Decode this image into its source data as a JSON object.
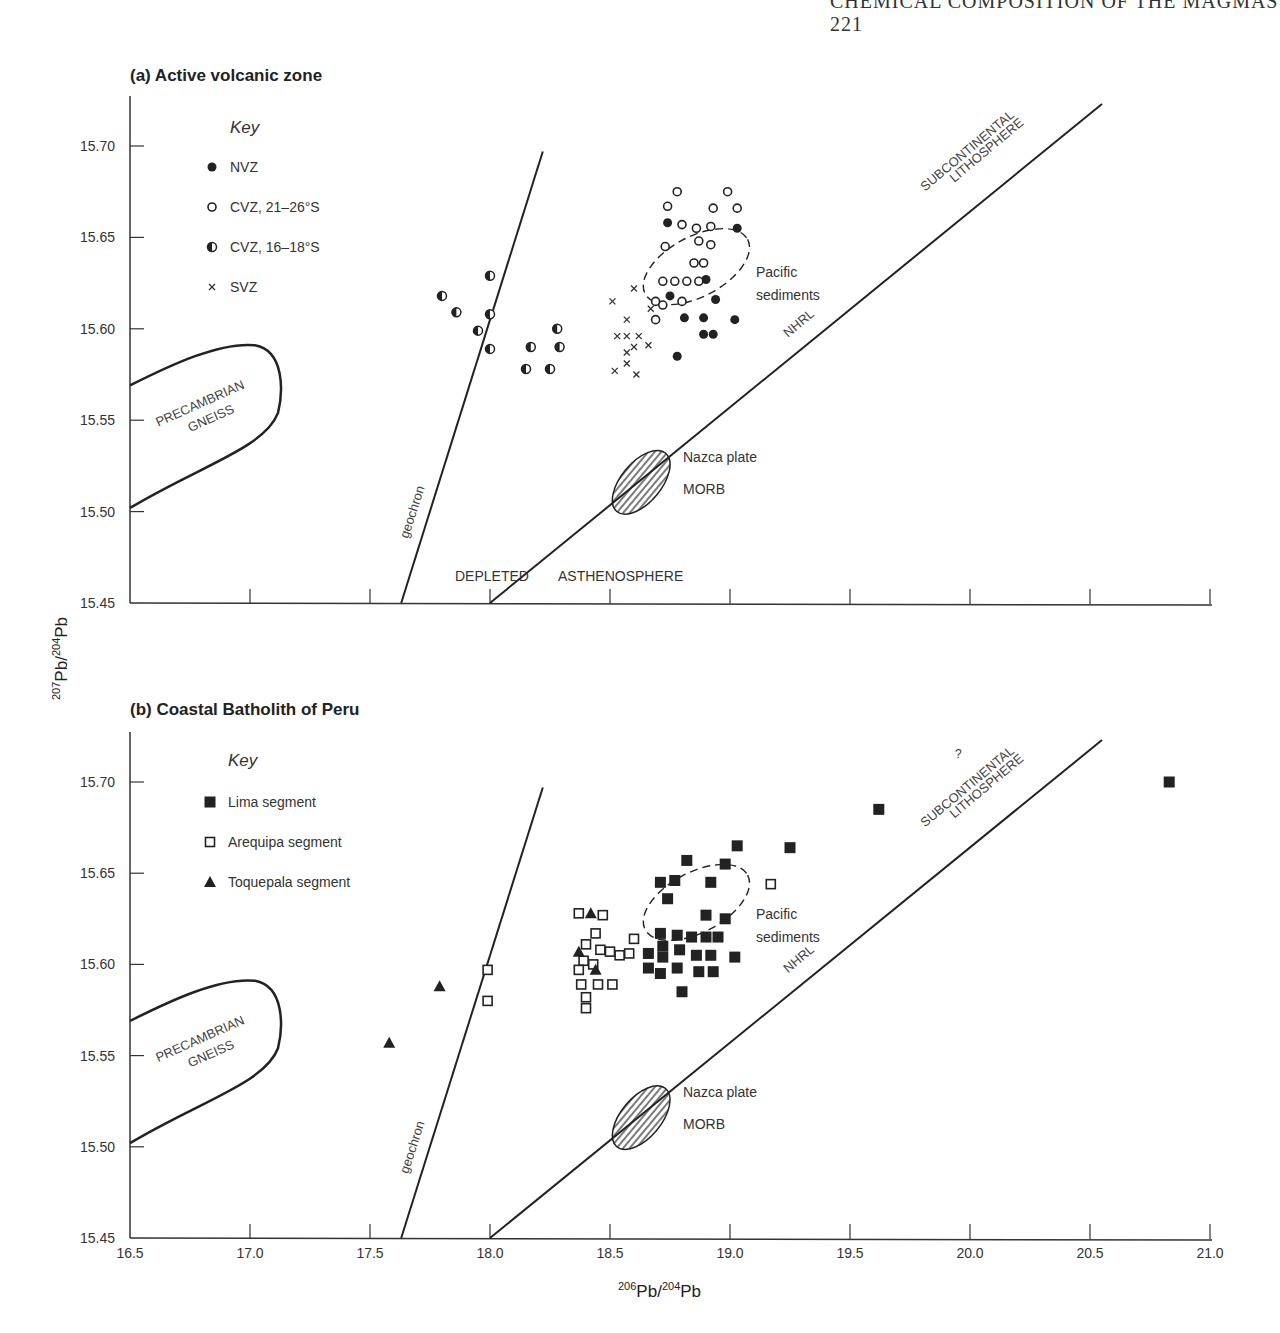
{
  "running_head": "CHEMICAL COMPOSITION OF THE MAGMAS   221",
  "y_axis_label": {
    "sup1": "207",
    "base1": "Pb/",
    "sup2": "204",
    "base2": "Pb"
  },
  "x_axis_label": {
    "sup1": "206",
    "base1": "Pb/",
    "sup2": "204",
    "base2": "Pb"
  },
  "panels": [
    {
      "title": "(a) Active volcanic zone",
      "key_title": "Key",
      "legend": [
        "NVZ",
        "CVZ, 21–26°S",
        "CVZ, 16–18°S",
        "SVZ"
      ],
      "labels": {
        "gneiss1": "PRECAMBRIAN",
        "gneiss2": "GNEISS",
        "geochron": "geochron",
        "depleted": "DEPLETED",
        "asthenosphere": "ASTHENOSPHERE",
        "nazca1": "Nazca plate",
        "nazca2": "MORB",
        "pacific1": "Pacific",
        "pacific2": "sediments",
        "nhrl": "NHRL",
        "subcont1": "SUBCONTINENTAL",
        "subcont2": "LITHOSPHERE"
      },
      "y_ticks": [
        "15.70",
        "15.65",
        "15.60",
        "15.55",
        "15.50",
        "15.45"
      ]
    },
    {
      "title": "(b) Coastal Batholith of Peru",
      "key_title": "Key",
      "legend": [
        "Lima segment",
        "Arequipa segment",
        "Toquepala segment"
      ],
      "labels": {
        "gneiss1": "PRECAMBRIAN",
        "gneiss2": "GNEISS",
        "geochron": "geochron",
        "nazca1": "Nazca plate",
        "nazca2": "MORB",
        "pacific1": "Pacific",
        "pacific2": "sediments",
        "nhrl": "NHRL",
        "question": "?",
        "subcont1": "SUBCONTINENTAL",
        "subcont2": "LITHOSPHERE"
      },
      "y_ticks": [
        "15.70",
        "15.65",
        "15.60",
        "15.55",
        "15.50",
        "15.45"
      ],
      "x_ticks": [
        "16.5",
        "17.0",
        "17.5",
        "18.0",
        "18.5",
        "19.0",
        "19.5",
        "20.0",
        "20.5",
        "21.0"
      ]
    }
  ],
  "chart_data": [
    {
      "type": "scatter",
      "title": "(a) Active volcanic zone",
      "xlabel": "206Pb/204Pb",
      "ylabel": "207Pb/204Pb",
      "xlim": [
        16.5,
        21.0
      ],
      "ylim": [
        15.45,
        15.72
      ],
      "grid": false,
      "legend_position": "upper-left",
      "series": [
        {
          "name": "NVZ",
          "marker": "filled-circle",
          "points": [
            [
              18.74,
              15.658
            ],
            [
              19.03,
              15.655
            ],
            [
              18.9,
              15.627
            ],
            [
              18.75,
              15.618
            ],
            [
              18.94,
              15.616
            ],
            [
              18.81,
              15.606
            ],
            [
              18.89,
              15.606
            ],
            [
              19.02,
              15.605
            ],
            [
              18.89,
              15.597
            ],
            [
              18.93,
              15.597
            ],
            [
              18.78,
              15.585
            ]
          ]
        },
        {
          "name": "CVZ, 21–26°S",
          "marker": "open-circle",
          "points": [
            [
              18.78,
              15.675
            ],
            [
              18.99,
              15.675
            ],
            [
              18.74,
              15.667
            ],
            [
              18.93,
              15.666
            ],
            [
              19.03,
              15.666
            ],
            [
              18.8,
              15.657
            ],
            [
              18.86,
              15.655
            ],
            [
              18.92,
              15.656
            ],
            [
              18.73,
              15.645
            ],
            [
              18.87,
              15.648
            ],
            [
              18.92,
              15.646
            ],
            [
              18.85,
              15.636
            ],
            [
              18.89,
              15.636
            ],
            [
              18.72,
              15.626
            ],
            [
              18.77,
              15.626
            ],
            [
              18.82,
              15.626
            ],
            [
              18.87,
              15.626
            ],
            [
              18.69,
              15.615
            ],
            [
              18.72,
              15.613
            ],
            [
              18.8,
              15.615
            ],
            [
              18.69,
              15.605
            ]
          ]
        },
        {
          "name": "CVZ, 16–18°S",
          "marker": "half-filled-circle",
          "points": [
            [
              18.0,
              15.629
            ],
            [
              17.8,
              15.618
            ],
            [
              17.86,
              15.609
            ],
            [
              18.0,
              15.608
            ],
            [
              17.95,
              15.599
            ],
            [
              18.28,
              15.6
            ],
            [
              18.0,
              15.589
            ],
            [
              18.17,
              15.59
            ],
            [
              18.29,
              15.59
            ],
            [
              18.15,
              15.578
            ],
            [
              18.25,
              15.578
            ]
          ]
        },
        {
          "name": "SVZ",
          "marker": "x",
          "points": [
            [
              18.51,
              15.615
            ],
            [
              18.6,
              15.622
            ],
            [
              18.57,
              15.605
            ],
            [
              18.53,
              15.596
            ],
            [
              18.57,
              15.596
            ],
            [
              18.62,
              15.596
            ],
            [
              18.57,
              15.587
            ],
            [
              18.6,
              15.59
            ],
            [
              18.66,
              15.591
            ],
            [
              18.52,
              15.577
            ],
            [
              18.57,
              15.581
            ],
            [
              18.61,
              15.575
            ],
            [
              18.67,
              15.611
            ]
          ]
        }
      ],
      "reference_lines": [
        {
          "name": "geochron",
          "from": [
            17.63,
            15.45
          ],
          "to": [
            18.22,
            15.697
          ]
        },
        {
          "name": "NHRL",
          "from": [
            18.0,
            15.45
          ],
          "to": [
            20.55,
            15.723
          ]
        }
      ],
      "fields": [
        {
          "name": "Precambrian gneiss",
          "type": "outline"
        },
        {
          "name": "Nazca plate MORB",
          "type": "hatched-ellipse",
          "center": [
            18.63,
            15.516
          ]
        },
        {
          "name": "Pacific sediments",
          "type": "dashed-ellipse",
          "center": [
            18.86,
            15.634
          ]
        }
      ]
    },
    {
      "type": "scatter",
      "title": "(b) Coastal Batholith of Peru",
      "xlabel": "206Pb/204Pb",
      "ylabel": "207Pb/204Pb",
      "xlim": [
        16.5,
        21.0
      ],
      "ylim": [
        15.45,
        15.72
      ],
      "x_ticks": [
        16.5,
        17.0,
        17.5,
        18.0,
        18.5,
        19.0,
        19.5,
        20.0,
        20.5,
        21.0
      ],
      "y_ticks": [
        15.45,
        15.5,
        15.55,
        15.6,
        15.65,
        15.7
      ],
      "grid": false,
      "legend_position": "upper-left",
      "series": [
        {
          "name": "Lima segment",
          "marker": "filled-square",
          "points": [
            [
              20.83,
              15.7
            ],
            [
              19.62,
              15.685
            ],
            [
              19.03,
              15.665
            ],
            [
              19.25,
              15.664
            ],
            [
              18.82,
              15.657
            ],
            [
              18.98,
              15.655
            ],
            [
              18.71,
              15.645
            ],
            [
              18.77,
              15.646
            ],
            [
              18.92,
              15.645
            ],
            [
              18.74,
              15.636
            ],
            [
              18.9,
              15.627
            ],
            [
              18.98,
              15.625
            ],
            [
              18.71,
              15.617
            ],
            [
              18.78,
              15.616
            ],
            [
              18.84,
              15.615
            ],
            [
              18.9,
              15.615
            ],
            [
              18.95,
              15.615
            ],
            [
              18.72,
              15.61
            ],
            [
              18.79,
              15.608
            ],
            [
              18.66,
              15.606
            ],
            [
              18.72,
              15.604
            ],
            [
              18.86,
              15.605
            ],
            [
              18.92,
              15.605
            ],
            [
              19.02,
              15.604
            ],
            [
              18.66,
              15.598
            ],
            [
              18.71,
              15.595
            ],
            [
              18.78,
              15.598
            ],
            [
              18.87,
              15.596
            ],
            [
              18.93,
              15.596
            ],
            [
              18.8,
              15.585
            ]
          ]
        },
        {
          "name": "Arequipa segment",
          "marker": "open-square",
          "points": [
            [
              19.17,
              15.644
            ],
            [
              18.37,
              15.628
            ],
            [
              18.47,
              15.627
            ],
            [
              18.44,
              15.617
            ],
            [
              18.6,
              15.614
            ],
            [
              18.4,
              15.611
            ],
            [
              18.46,
              15.608
            ],
            [
              18.5,
              15.607
            ],
            [
              18.54,
              15.605
            ],
            [
              18.58,
              15.606
            ],
            [
              18.39,
              15.602
            ],
            [
              18.37,
              15.597
            ],
            [
              18.43,
              15.6
            ],
            [
              18.38,
              15.589
            ],
            [
              18.45,
              15.589
            ],
            [
              18.51,
              15.589
            ],
            [
              18.4,
              15.582
            ],
            [
              18.4,
              15.576
            ],
            [
              17.99,
              15.597
            ],
            [
              17.99,
              15.58
            ]
          ]
        },
        {
          "name": "Toquepala segment",
          "marker": "filled-triangle",
          "points": [
            [
              18.42,
              15.628
            ],
            [
              18.37,
              15.607
            ],
            [
              18.44,
              15.597
            ],
            [
              17.79,
              15.588
            ],
            [
              17.58,
              15.557
            ]
          ]
        }
      ],
      "reference_lines": [
        {
          "name": "geochron",
          "from": [
            17.63,
            15.45
          ],
          "to": [
            18.22,
            15.697
          ]
        },
        {
          "name": "NHRL",
          "from": [
            18.0,
            15.45
          ],
          "to": [
            20.55,
            15.723
          ]
        }
      ],
      "fields": [
        {
          "name": "Precambrian gneiss",
          "type": "outline"
        },
        {
          "name": "Nazca plate MORB",
          "type": "hatched-ellipse",
          "center": [
            18.63,
            15.516
          ]
        },
        {
          "name": "Pacific sediments",
          "type": "dashed-ellipse",
          "center": [
            18.86,
            15.634
          ]
        }
      ]
    }
  ]
}
